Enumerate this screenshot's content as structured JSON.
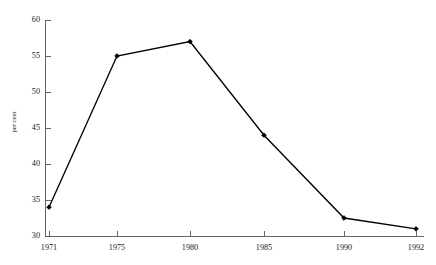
{
  "chart_data": {
    "type": "line",
    "title": "",
    "subtitle": "",
    "xlabel": "",
    "ylabel": "per cent",
    "categories": [
      "1971",
      "1975",
      "1980",
      "1985",
      "1990",
      "1992"
    ],
    "x": [
      1971,
      1975,
      1980,
      1985,
      1990,
      1992
    ],
    "values": [
      34,
      55,
      57,
      44,
      32.5,
      31
    ],
    "series": [
      {
        "name": "per cent",
        "values": [
          34,
          55,
          57,
          44,
          32.5,
          31
        ]
      }
    ],
    "xlim": [
      1971,
      1992
    ],
    "ylim": [
      30,
      60
    ],
    "ytick_labels": [
      "30",
      "35",
      "40",
      "45",
      "50",
      "55",
      "60"
    ],
    "yticks": [
      30,
      35,
      40,
      45,
      50,
      55,
      60
    ],
    "xtick_labels": [
      "1971",
      "1975",
      "1980",
      "1985",
      "1990",
      "1992"
    ],
    "grid": false,
    "legend": false,
    "legend_position": "none",
    "marker": "filled-diamond",
    "line_color": "#000000",
    "axis_color": "#555555",
    "background_color": "#ffffff"
  }
}
